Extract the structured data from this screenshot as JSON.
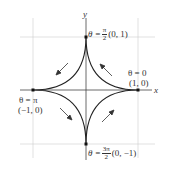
{
  "diagram": {
    "axes": {
      "x_label": "x",
      "y_label": "y"
    },
    "colors": {
      "curve": "#222222",
      "grid": "#cccccc",
      "axes": "#444444",
      "arrow": "#333333",
      "text": "#333333"
    },
    "points": [
      {
        "id": "top",
        "theta_prefix": "θ =",
        "theta_num": "π",
        "theta_den": "2",
        "coord": "(0, 1)"
      },
      {
        "id": "right",
        "theta": "θ = 0",
        "coord": "(1, 0)"
      },
      {
        "id": "left",
        "theta": "θ = π",
        "coord": "(−1, 0)"
      },
      {
        "id": "bottom",
        "theta_prefix": "θ =",
        "theta_num": "3π",
        "theta_den": "2",
        "coord": "(0, −1)"
      }
    ],
    "arrows": [
      "upper-left: toward left cusp",
      "upper-right: toward top cusp",
      "lower-left: toward bottom cusp",
      "lower-right: toward right cusp"
    ]
  }
}
